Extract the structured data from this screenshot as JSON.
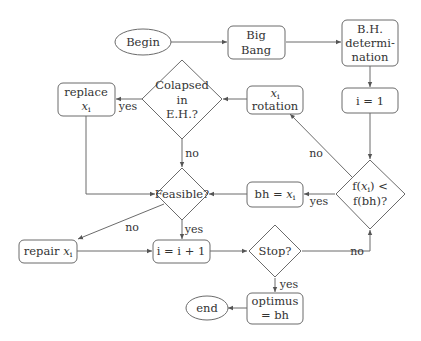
{
  "nodes": {
    "begin": {
      "label": "Begin",
      "shape": "ellipse"
    },
    "big_bang": {
      "line1": "Big",
      "line2": "Bang",
      "shape": "rounded-rect"
    },
    "bh_determination": {
      "line1": "B.H.",
      "line2": "determi-",
      "line3": "nation",
      "shape": "rounded-rect"
    },
    "i_equals_1": {
      "label": "i = 1",
      "shape": "rounded-rect"
    },
    "xi_rotation": {
      "line1": "x",
      "line1_sub": "i",
      "line2": "rotation",
      "shape": "rounded-rect"
    },
    "colapsed": {
      "line1": "Colapsed",
      "line2": "in",
      "line3": "E.H.?",
      "shape": "diamond"
    },
    "replace_xi": {
      "line1": "replace",
      "line2": "x",
      "line2_sub": "i",
      "shape": "rounded-rect"
    },
    "feasible": {
      "label": "Feasible?",
      "shape": "diamond"
    },
    "bh_equals_xi": {
      "label": "bh = ",
      "var": "x",
      "var_sub": "i",
      "shape": "rounded-rect"
    },
    "compare": {
      "line1_pre": "f(",
      "line1_var": "x",
      "line1_sub": "i",
      "line1_post": ") <",
      "line2": "f(bh)?",
      "shape": "diamond"
    },
    "repair_xi": {
      "label": "repair ",
      "var": "x",
      "var_sub": "i",
      "shape": "rounded-rect"
    },
    "increment": {
      "label": "i = i + 1",
      "shape": "rounded-rect"
    },
    "stop": {
      "label": "Stop?",
      "shape": "diamond"
    },
    "optimus": {
      "line1": "optimus",
      "line2": "= bh",
      "shape": "rounded-rect"
    },
    "end": {
      "label": "end",
      "shape": "ellipse"
    }
  },
  "edge_labels": {
    "colapsed_yes": "yes",
    "colapsed_no": "no",
    "feasible_no": "no",
    "feasible_yes": "yes",
    "compare_yes": "yes",
    "compare_no": "no",
    "stop_no": "no",
    "stop_yes": "yes"
  },
  "colors": {
    "stroke": "#6b6b6b",
    "text": "#333333",
    "background": "#ffffff"
  }
}
